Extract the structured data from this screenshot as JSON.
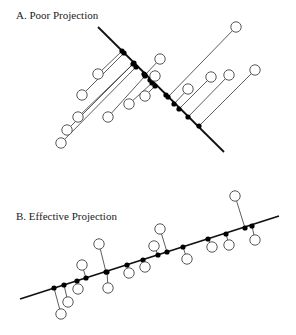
{
  "colors": {
    "axis": "#111111",
    "connector": "#333333",
    "point_stroke": "#444444",
    "point_fill": "#ffffff",
    "projection": "#000000"
  },
  "panels": [
    {
      "id": "A",
      "title": "A. Poor Projection",
      "title_pos": [
        16,
        8
      ],
      "axis": [
        [
          98,
          27
        ],
        [
          224,
          152
        ]
      ],
      "pairs": [
        {
          "p": [
            236,
            27
          ],
          "q": [
            168,
            97
          ]
        },
        {
          "p": [
            160,
            59
          ],
          "q": [
            145,
            75
          ]
        },
        {
          "p": [
            155,
            76
          ],
          "q": [
            150,
            80
          ]
        },
        {
          "p": [
            98,
            74
          ],
          "q": [
            122,
            51
          ]
        },
        {
          "p": [
            82,
            95
          ],
          "q": [
            124,
            53
          ]
        },
        {
          "p": [
            211,
            77
          ],
          "q": [
            179,
            109
          ]
        },
        {
          "p": [
            229,
            75
          ],
          "q": [
            188,
            117
          ]
        },
        {
          "p": [
            255,
            70
          ],
          "q": [
            199,
            126
          ]
        },
        {
          "p": [
            188,
            89
          ],
          "q": [
            174,
            104
          ]
        },
        {
          "p": [
            145,
            96
          ],
          "q": [
            155,
            86
          ]
        },
        {
          "p": [
            129,
            104
          ],
          "q": [
            152,
            83
          ]
        },
        {
          "p": [
            108,
            117
          ],
          "q": [
            145,
            76
          ]
        },
        {
          "p": [
            78,
            117
          ],
          "q": [
            134,
            63
          ]
        },
        {
          "p": [
            67,
            130
          ],
          "q": [
            133,
            64
          ]
        },
        {
          "p": [
            61,
            143
          ],
          "q": [
            136,
            67
          ]
        }
      ],
      "extra_projections": [
        [
          166,
          95
        ],
        [
          144,
          74
        ]
      ]
    },
    {
      "id": "B",
      "title": "B. Effective Projection",
      "title_pos": [
        16,
        209
      ],
      "axis": [
        [
          20,
          299
        ],
        [
          279,
          216
        ]
      ],
      "pairs": [
        {
          "p": [
            61,
            314
          ],
          "q": [
            54,
            288
          ]
        },
        {
          "p": [
            68,
            302
          ],
          "q": [
            64,
            285
          ]
        },
        {
          "p": [
            78,
            289
          ],
          "q": [
            77,
            281
          ]
        },
        {
          "p": [
            82,
            265
          ],
          "q": [
            86,
            278
          ]
        },
        {
          "p": [
            99,
            244
          ],
          "q": [
            106,
            272
          ]
        },
        {
          "p": [
            108,
            288
          ],
          "q": [
            107,
            272
          ]
        },
        {
          "p": [
            129,
            273
          ],
          "q": [
            127,
            265
          ]
        },
        {
          "p": [
            145,
            267
          ],
          "q": [
            143,
            260
          ]
        },
        {
          "p": [
            154,
            246
          ],
          "q": [
            158,
            255
          ]
        },
        {
          "p": [
            160,
            229
          ],
          "q": [
            167,
            252
          ]
        },
        {
          "p": [
            187,
            259
          ],
          "q": [
            183,
            247
          ]
        },
        {
          "p": [
            212,
            247
          ],
          "q": [
            208,
            239
          ]
        },
        {
          "p": [
            229,
            245
          ],
          "q": [
            226,
            234
          ]
        },
        {
          "p": [
            235,
            196
          ],
          "q": [
            245,
            228
          ]
        },
        {
          "p": [
            255,
            240
          ],
          "q": [
            252,
            226
          ]
        }
      ],
      "extra_projections": []
    }
  ]
}
